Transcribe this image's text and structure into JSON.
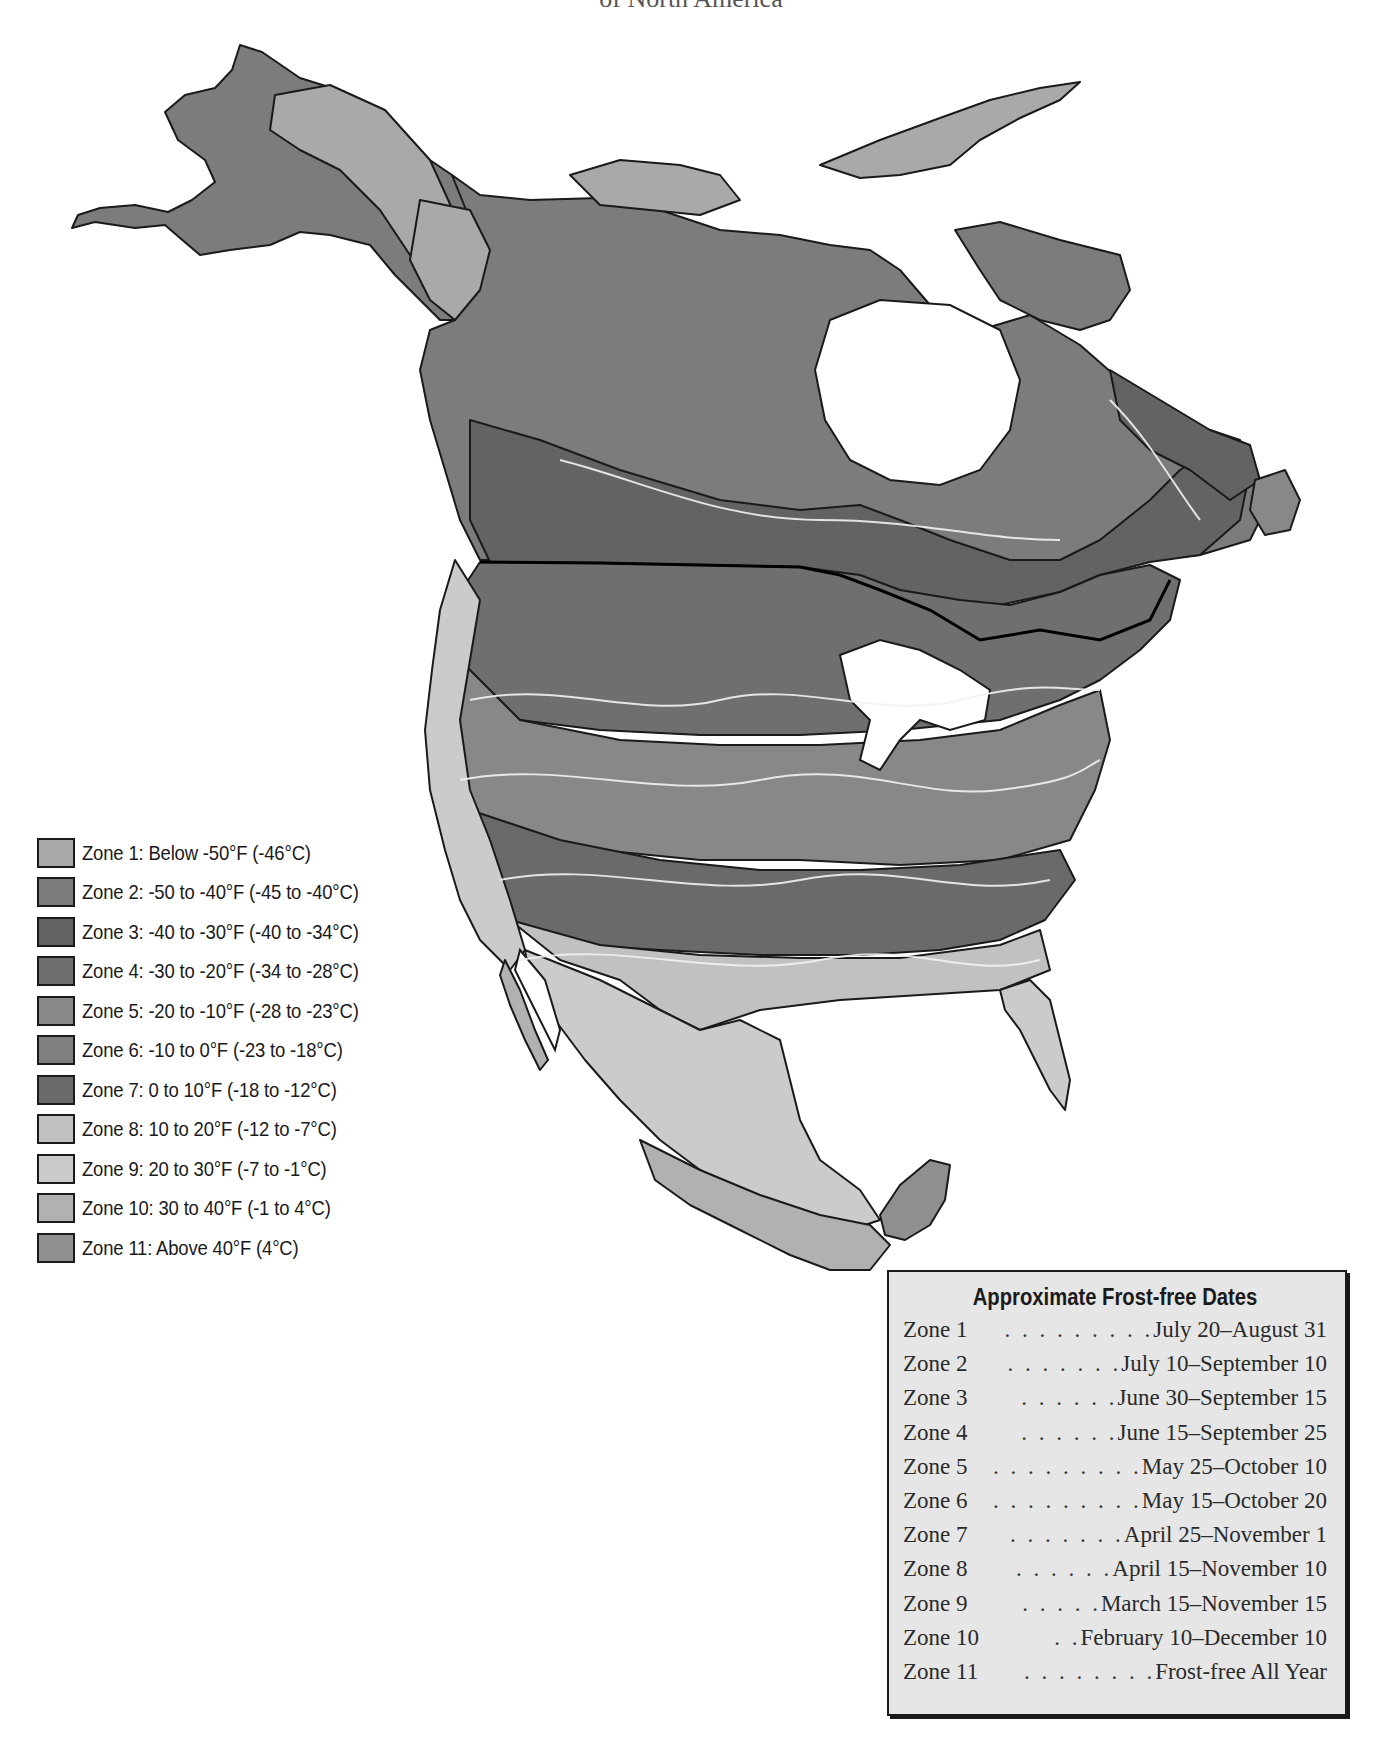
{
  "header": {
    "subtitle": "of North America"
  },
  "colors": {
    "water": "#ffffff",
    "isoline": "#f2f2f2",
    "border": "#1a1a1a",
    "frost_box_bg": "#e6e6e6"
  },
  "legend": {
    "items": [
      {
        "zone": 1,
        "label": "Zone 1: Below -50°F (-46°C)",
        "color": "#a9a9a9"
      },
      {
        "zone": 2,
        "label": "Zone 2: -50 to -40°F (-45 to -40°C)",
        "color": "#7c7c7c"
      },
      {
        "zone": 3,
        "label": "Zone 3: -40 to -30°F (-40 to -34°C)",
        "color": "#636363"
      },
      {
        "zone": 4,
        "label": "Zone 4: -30 to -20°F (-34 to -28°C)",
        "color": "#6f6f6f"
      },
      {
        "zone": 5,
        "label": "Zone 5: -20 to -10°F (-28 to -23°C)",
        "color": "#888888"
      },
      {
        "zone": 6,
        "label": "Zone 6: -10 to 0°F (-23 to -18°C)",
        "color": "#7f7f7f"
      },
      {
        "zone": 7,
        "label": "Zone 7: 0 to 10°F (-18 to -12°C)",
        "color": "#6a6a6a"
      },
      {
        "zone": 8,
        "label": "Zone 8: 10 to 20°F (-12 to -7°C)",
        "color": "#c1c1c1"
      },
      {
        "zone": 9,
        "label": "Zone 9: 20 to 30°F (-7 to -1°C)",
        "color": "#cbcbcb"
      },
      {
        "zone": 10,
        "label": "Zone 10: 30 to 40°F (-1 to 4°C)",
        "color": "#b1b1b1"
      },
      {
        "zone": 11,
        "label": "Zone 11: Above 40°F (4°C)",
        "color": "#8f8f8f"
      }
    ]
  },
  "frost_free": {
    "title": "Approximate Frost-free Dates",
    "rows": [
      {
        "zone": "Zone 1",
        "dots": ". . . . . . . . .",
        "dates": "July 20–August 31"
      },
      {
        "zone": "Zone 2",
        "dots": ". . . . . . .",
        "dates": "July 10–September 10"
      },
      {
        "zone": "Zone 3",
        "dots": ". . . . . .",
        "dates": "June 30–September 15"
      },
      {
        "zone": "Zone 4",
        "dots": ". . . . . .",
        "dates": "June 15–September 25"
      },
      {
        "zone": "Zone 5",
        "dots": ". . . . . . . . .",
        "dates": "May 25–October 10"
      },
      {
        "zone": "Zone 6",
        "dots": ". . . . . . . . .",
        "dates": "May 15–October 20"
      },
      {
        "zone": "Zone 7",
        "dots": ". . . . . . .",
        "dates": "April 25–November 1"
      },
      {
        "zone": "Zone 8",
        "dots": ". . . . . .",
        "dates": "April 15–November 10"
      },
      {
        "zone": "Zone 9",
        "dots": ". . . . .",
        "dates": "March 15–November 15"
      },
      {
        "zone": "Zone 10",
        "dots": ". .",
        "dates": "February 10–December 10"
      },
      {
        "zone": "Zone 11",
        "dots": ". . . . . . . .",
        "dates": "Frost-free All Year"
      }
    ]
  },
  "map": {
    "regions": [
      {
        "name": "alaska",
        "zone": 2
      },
      {
        "name": "alaska-interior",
        "zone": 1
      },
      {
        "name": "yukon",
        "zone": 1
      },
      {
        "name": "arctic-islands",
        "zone": 1
      },
      {
        "name": "canada-north",
        "zone": 2
      },
      {
        "name": "canada-prairies",
        "zone": 3
      },
      {
        "name": "quebec-labrador",
        "zone": 3
      },
      {
        "name": "us-north-plains",
        "zone": 4
      },
      {
        "name": "us-midwest",
        "zone": 5
      },
      {
        "name": "us-south",
        "zone": 7
      },
      {
        "name": "us-gulf-coast",
        "zone": 8
      },
      {
        "name": "florida",
        "zone": 9
      },
      {
        "name": "pacific-coast",
        "zone": 9
      },
      {
        "name": "mexico-plateau",
        "zone": 9
      },
      {
        "name": "mexico-coast",
        "zone": 10
      },
      {
        "name": "yucatan",
        "zone": 11
      }
    ]
  }
}
